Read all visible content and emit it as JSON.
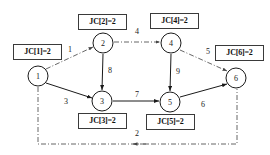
{
  "diagram": {
    "canvas": {
      "width": 270,
      "height": 155
    },
    "colors": {
      "node_stroke": "#1a1a1a",
      "node_fill": "#ffffff",
      "solid_edge": "#1a1a1a",
      "dashdot_edge": "#555555",
      "box_border": "#3a3a3a",
      "text": "#111111",
      "background": "#ffffff"
    },
    "nodes": [
      {
        "id": "1",
        "label": "1",
        "cx": 38,
        "cy": 76,
        "r": 10
      },
      {
        "id": "2",
        "label": "2",
        "cx": 103,
        "cy": 43,
        "r": 10
      },
      {
        "id": "3",
        "label": "3",
        "cx": 102,
        "cy": 101,
        "r": 10
      },
      {
        "id": "4",
        "label": "4",
        "cx": 171,
        "cy": 43,
        "r": 10
      },
      {
        "id": "5",
        "label": "5",
        "cx": 170,
        "cy": 102,
        "r": 10
      },
      {
        "id": "6",
        "label": "6",
        "cx": 236,
        "cy": 78,
        "r": 10
      }
    ],
    "edges": [
      {
        "from": "1",
        "to": "2",
        "weight": "1",
        "style": "dashdot",
        "label_x": 70,
        "label_y": 50
      },
      {
        "from": "2",
        "to": "4",
        "weight": "4",
        "style": "dashdot",
        "label_x": 137,
        "label_y": 32
      },
      {
        "from": "4",
        "to": "6",
        "weight": "5",
        "style": "dashdot",
        "label_x": 208,
        "label_y": 52
      },
      {
        "from": "1",
        "to": "6",
        "weight": "2",
        "style": "dashdot",
        "label_x": 137,
        "label_y": 134
      },
      {
        "from": "2",
        "to": "3",
        "weight": "8",
        "style": "solid",
        "label_x": 110,
        "label_y": 71
      },
      {
        "from": "1",
        "to": "3",
        "weight": "3",
        "style": "solid",
        "label_x": 66,
        "label_y": 102
      },
      {
        "from": "3",
        "to": "5",
        "weight": "7",
        "style": "solid",
        "label_x": 137,
        "label_y": 95
      },
      {
        "from": "4",
        "to": "5",
        "weight": "9",
        "style": "solid",
        "label_x": 178,
        "label_y": 72
      },
      {
        "from": "5",
        "to": "6",
        "weight": "6",
        "style": "solid",
        "label_x": 203,
        "label_y": 105
      }
    ],
    "jc_boxes": [
      {
        "id": "jc1",
        "text": "JC[1]=2",
        "x": 13,
        "y": 44,
        "w": 49,
        "h": 16
      },
      {
        "id": "jc2",
        "text": "JC[2]=2",
        "x": 78,
        "y": 14,
        "w": 49,
        "h": 16
      },
      {
        "id": "jc3",
        "text": "JC[3]=2",
        "x": 78,
        "y": 113,
        "w": 49,
        "h": 16
      },
      {
        "id": "jc4",
        "text": "JC[4]=2",
        "x": 150,
        "y": 13,
        "w": 49,
        "h": 16
      },
      {
        "id": "jc5",
        "text": "JC[5]=2",
        "x": 146,
        "y": 114,
        "w": 49,
        "h": 16
      },
      {
        "id": "jc6",
        "text": "JC[6]=2",
        "x": 215,
        "y": 45,
        "w": 49,
        "h": 16
      }
    ]
  }
}
